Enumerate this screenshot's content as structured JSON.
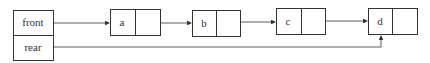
{
  "queue": {
    "front_label": "front",
    "rear_label": "rear"
  },
  "nodes": [
    {
      "data": "a"
    },
    {
      "data": "b"
    },
    {
      "data": "c"
    },
    {
      "data": "d"
    }
  ],
  "colors": {
    "stroke": "#333333",
    "background": "#ffffff"
  }
}
